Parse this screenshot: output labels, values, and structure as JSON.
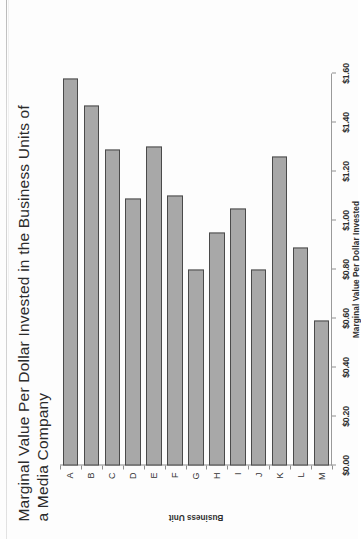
{
  "document": {
    "kind": "scanned-figure",
    "orientation": "rotated-90-ccw"
  },
  "chart_data": {
    "type": "bar",
    "orientation": "horizontal",
    "title": "Marginal Value Per Dollar Invested in the Business Units of a Media Company",
    "xlabel": "Marginal Value Per Dollar Invested",
    "ylabel": "Business Unit",
    "categories": [
      "A",
      "B",
      "C",
      "D",
      "E",
      "F",
      "G",
      "H",
      "I",
      "J",
      "K",
      "L",
      "M"
    ],
    "values": [
      1.58,
      1.47,
      1.29,
      1.09,
      1.3,
      1.1,
      0.8,
      0.95,
      1.05,
      0.8,
      1.26,
      0.89,
      0.59
    ],
    "value_axis_range": [
      0.0,
      1.6
    ],
    "value_axis_ticks": [
      "$0.00",
      "$0.20",
      "$0.40",
      "$0.60",
      "$0.80",
      "$1.00",
      "$1.20",
      "$1.40",
      "$1.60"
    ],
    "value_axis_tick_values": [
      0.0,
      0.2,
      0.4,
      0.6,
      0.8,
      1.0,
      1.2,
      1.4,
      1.6
    ],
    "grid": false,
    "legend": false,
    "bar_fill_color": "#a8a8a8",
    "bar_border_color": "#4a4a4a",
    "axis_color": "#8f8f8f",
    "series": [
      {
        "name": "Marginal Value Per Dollar Invested",
        "values": [
          1.58,
          1.47,
          1.29,
          1.09,
          1.3,
          1.1,
          0.8,
          0.95,
          1.05,
          0.8,
          1.26,
          0.89,
          0.59
        ]
      }
    ]
  }
}
